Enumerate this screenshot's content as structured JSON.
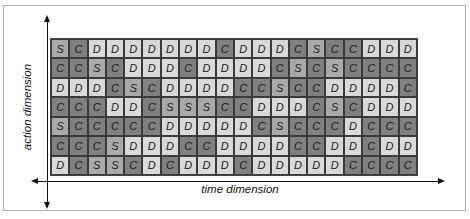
{
  "diagram": {
    "x_axis_label": "time dimension",
    "y_axis_label": "action dimension",
    "legend_colors": {
      "S": "#a9a9a9",
      "C": "#808080",
      "D": "#d9d9d9"
    },
    "rows": [
      [
        "S",
        "C",
        "D",
        "D",
        "D",
        "D",
        "D",
        "D",
        "D",
        "C",
        "D",
        "D",
        "D",
        "C",
        "S",
        "C",
        "C",
        "D",
        "D",
        "D"
      ],
      [
        "C",
        "C",
        "S",
        "C",
        "D",
        "D",
        "D",
        "C",
        "D",
        "D",
        "D",
        "D",
        "C",
        "S",
        "C",
        "S",
        "C",
        "C",
        "C",
        "C"
      ],
      [
        "D",
        "D",
        "D",
        "C",
        "S",
        "C",
        "D",
        "D",
        "D",
        "D",
        "C",
        "C",
        "S",
        "C",
        "C",
        "D",
        "D",
        "D",
        "D",
        "C"
      ],
      [
        "C",
        "C",
        "C",
        "D",
        "D",
        "C",
        "S",
        "S",
        "S",
        "C",
        "C",
        "D",
        "D",
        "D",
        "C",
        "S",
        "C",
        "D",
        "D",
        "D"
      ],
      [
        "S",
        "C",
        "C",
        "C",
        "C",
        "C",
        "D",
        "D",
        "D",
        "D",
        "D",
        "C",
        "S",
        "C",
        "C",
        "C",
        "D",
        "C",
        "C",
        "C"
      ],
      [
        "C",
        "C",
        "C",
        "S",
        "D",
        "D",
        "D",
        "C",
        "C",
        "D",
        "D",
        "D",
        "D",
        "C",
        "C",
        "D",
        "D",
        "C",
        "D",
        "D"
      ],
      [
        "D",
        "C",
        "S",
        "S",
        "C",
        "D",
        "C",
        "D",
        "D",
        "D",
        "C",
        "D",
        "D",
        "D",
        "D",
        "D",
        "C",
        "C",
        "C",
        "C"
      ]
    ]
  }
}
